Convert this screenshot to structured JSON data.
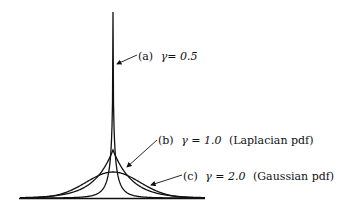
{
  "figure": {
    "ink_color": "#111111",
    "background_color": "#ffffff",
    "curves": [
      {
        "id": "a",
        "label": "(a)",
        "gamma_text": "γ= 0.5",
        "gamma": 0.5,
        "note": ""
      },
      {
        "id": "b",
        "label": "(b)",
        "gamma_text": "γ = 1.0",
        "gamma": 1.0,
        "note": "(Laplacian pdf)"
      },
      {
        "id": "c",
        "label": "(c)",
        "gamma_text": "γ = 2.0",
        "gamma": 2.0,
        "note": "(Gaussian pdf)"
      }
    ]
  },
  "chart_data": {
    "type": "line",
    "title": "",
    "xlabel": "",
    "ylabel": "",
    "grid": false,
    "legend_position": "inline annotations with leader arrows",
    "series": [
      {
        "name": "(a) γ = 0.5",
        "shape": "sharply peaked",
        "relative_peak_height": 1.0
      },
      {
        "name": "(b) γ = 1.0 (Laplacian pdf)",
        "shape": "cusp",
        "relative_peak_height": 0.26
      },
      {
        "name": "(c) γ = 2.0 (Gaussian pdf)",
        "shape": "bell",
        "relative_peak_height": 0.14
      }
    ]
  }
}
